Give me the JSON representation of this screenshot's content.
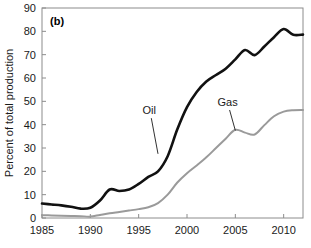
{
  "chart_data": {
    "type": "line",
    "title": "",
    "panel_label": "(b)",
    "xlabel": "",
    "ylabel": "Percent of total production",
    "xlim": [
      1985,
      2012
    ],
    "ylim": [
      0,
      90
    ],
    "xticks": [
      1985,
      1990,
      1995,
      2000,
      2005,
      2010
    ],
    "yticks": [
      0,
      10,
      20,
      30,
      40,
      50,
      60,
      70,
      80,
      90
    ],
    "grid": false,
    "legend": "inline-annotations",
    "x": [
      1985,
      1986,
      1987,
      1988,
      1989,
      1990,
      1991,
      1992,
      1993,
      1994,
      1995,
      1996,
      1997,
      1998,
      1999,
      2000,
      2001,
      2002,
      2003,
      2004,
      2005,
      2006,
      2007,
      2008,
      2009,
      2010,
      2011,
      2012
    ],
    "series": [
      {
        "name": "Oil",
        "color": "#111111",
        "label_x": 1996.1,
        "label_y": 44.5,
        "values": [
          6.2,
          5.8,
          5.4,
          4.8,
          4.0,
          4.4,
          7.5,
          12.2,
          11.6,
          12.2,
          14.6,
          17.6,
          20.0,
          26.5,
          38.0,
          47.5,
          54.0,
          58.5,
          61.3,
          64.0,
          68.0,
          72.0,
          69.8,
          73.5,
          77.5,
          81.0,
          78.5,
          78.6
        ]
      },
      {
        "name": "Gas",
        "color": "#9a9a9a",
        "label_x": 2004.2,
        "label_y": 48.0,
        "values": [
          1.2,
          1.1,
          1.0,
          0.9,
          0.8,
          0.6,
          1.3,
          2.0,
          2.6,
          3.2,
          3.8,
          4.6,
          6.4,
          10.0,
          15.2,
          19.2,
          22.5,
          26.0,
          30.0,
          34.0,
          37.8,
          36.6,
          35.8,
          39.8,
          43.6,
          45.6,
          46.2,
          46.3
        ]
      }
    ],
    "annotations": [
      {
        "text": "Oil",
        "points_to_x": 1997.0,
        "points_to_y": 27.5
      },
      {
        "text": "Gas",
        "points_to_x": 2005.0,
        "points_to_y": 37.5
      }
    ]
  }
}
